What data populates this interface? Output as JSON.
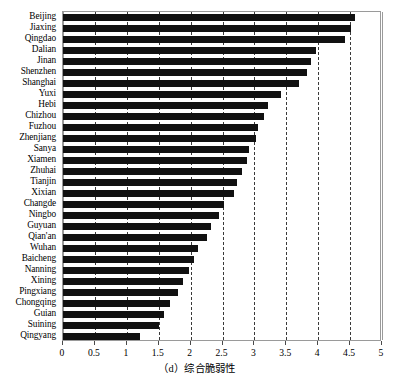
{
  "chart_data": {
    "type": "bar",
    "orientation": "horizontal",
    "title": "",
    "caption": "（d）综合脆弱性",
    "xlabel": "",
    "ylabel": "",
    "xlim": [
      0,
      5
    ],
    "ylim": null,
    "grid": true,
    "grid_axis": "x",
    "grid_style": "dashed",
    "legend": null,
    "legend_position": "none",
    "bar_color": "#111111",
    "xticks": [
      0,
      0.5,
      1,
      1.5,
      2,
      2.5,
      3,
      3.5,
      4,
      4.5,
      5
    ],
    "xtick_labels": [
      "0",
      "0.5",
      "1",
      "1.5",
      "2",
      "2.5",
      "3",
      "3.5",
      "4",
      "4.5",
      "5"
    ],
    "categories": [
      "Beijing",
      "Jiaxing",
      "Qingdao",
      "Dalian",
      "Jinan",
      "Shenzhen",
      "Shanghai",
      "Yuxi",
      "Hebi",
      "Chizhou",
      "Fuzhou",
      "Zhenjiang",
      "Sanya",
      "Xiamen",
      "Zhuhai",
      "Tianjin",
      "Xixian",
      "Changde",
      "Ningbo",
      "Guyuan",
      "Qian'an",
      "Wuhan",
      "Baicheng",
      "Nanning",
      "Xining",
      "Pingxiang",
      "Chongqing",
      "Guian",
      "Suining",
      "Qingyang"
    ],
    "values": [
      4.58,
      4.52,
      4.42,
      3.97,
      3.88,
      3.82,
      3.7,
      3.42,
      3.22,
      3.15,
      3.05,
      3.03,
      2.92,
      2.88,
      2.8,
      2.72,
      2.68,
      2.52,
      2.45,
      2.32,
      2.25,
      2.12,
      2.05,
      1.97,
      1.88,
      1.8,
      1.68,
      1.58,
      1.5,
      1.2
    ]
  }
}
